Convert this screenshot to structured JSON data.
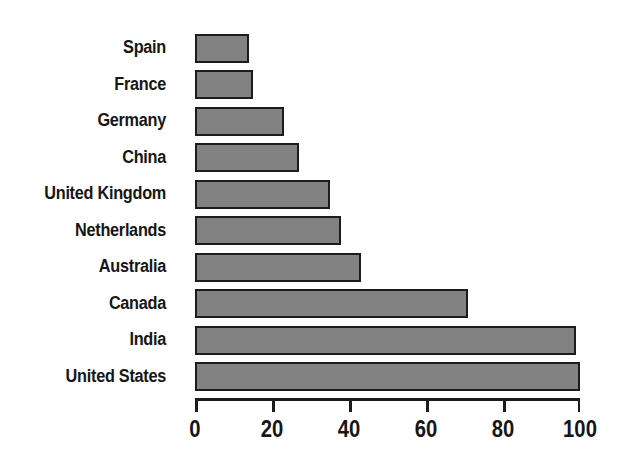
{
  "chart_data": {
    "type": "bar",
    "orientation": "horizontal",
    "title": "",
    "subtitle": "",
    "xlabel": "",
    "ylabel": "",
    "categories": [
      "Spain",
      "France",
      "Germany",
      "China",
      "United Kingdom",
      "Netherlands",
      "Australia",
      "Canada",
      "India",
      "United States"
    ],
    "values": [
      14,
      15,
      23,
      27,
      35,
      38,
      43,
      71,
      99,
      100
    ],
    "xlim": [
      0,
      100
    ],
    "x_ticks": [
      0,
      20,
      40,
      60,
      80,
      100
    ],
    "x_tick_labels": [
      "0",
      "20",
      "40",
      "60",
      "80",
      "100"
    ],
    "grid": false,
    "legend": null,
    "bar_fill_color": "#828282",
    "bar_border_color": "#1c1c1c",
    "axis_color": "#1c1c1c",
    "background_color": "#ffffff",
    "text_color": "#161616"
  }
}
